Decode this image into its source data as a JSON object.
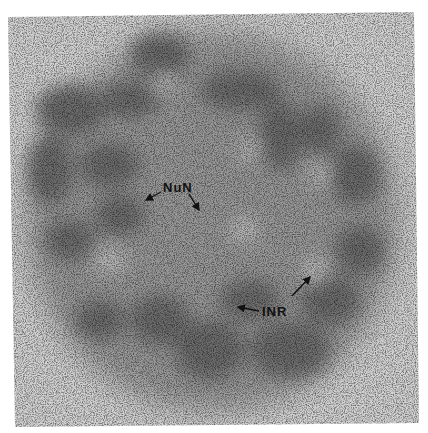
{
  "figure": {
    "annotations": [
      {
        "id": "nun",
        "text": "NuN",
        "arrow_count": 2
      },
      {
        "id": "inr",
        "text": "INR",
        "arrow_count": 2
      }
    ]
  }
}
